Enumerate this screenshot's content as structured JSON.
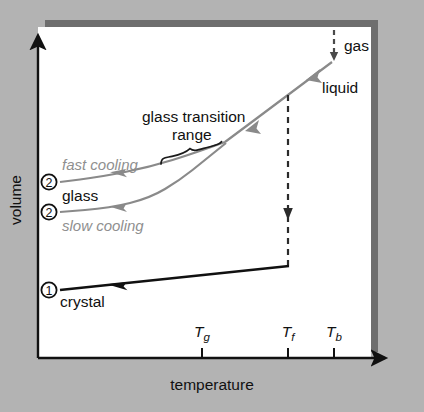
{
  "figure": {
    "background_color": "#b3b3b3",
    "panel_color": "#ffffff",
    "shadow_color": "#6e6e6e",
    "axis_color": "#111111",
    "crystal_color": "#111111",
    "glass_color": "#8a8a8a",
    "liquid_color": "#8a8a8a",
    "gray_label_color": "#8f8f8f"
  },
  "axes": {
    "x_label": "temperature",
    "y_label": "volume",
    "x_ticks": [
      {
        "label": "Tg",
        "base": "T",
        "sub": "g",
        "x": 202
      },
      {
        "label": "Tf",
        "base": "T",
        "sub": "f",
        "x": 288
      },
      {
        "label": "Tb",
        "base": "T",
        "sub": "b",
        "x": 334
      }
    ]
  },
  "labels": {
    "gas": "gas",
    "liquid": "liquid",
    "glass": "glass",
    "crystal": "crystal",
    "fast_cooling": "fast cooling",
    "slow_cooling": "slow cooling",
    "glass_transition_line1": "glass transition",
    "glass_transition_line2": "range",
    "state_marker_one": "1",
    "state_marker_two_fast": "2",
    "state_marker_two_slow": "2"
  },
  "chart_data": {
    "type": "line",
    "title": "",
    "xlabel": "temperature",
    "ylabel": "volume",
    "grid": false,
    "legend": "none",
    "axis_note": "Qualitative schematic: volume versus temperature on cooling; axes unitless with named transition temperatures Tg (glass transition), Tf (freezing/melting), Tb (boiling).",
    "x_tick_labels": [
      "Tg",
      "Tf",
      "Tb"
    ],
    "annotations": [
      "gas",
      "liquid",
      "glass",
      "crystal",
      "fast cooling",
      "slow cooling",
      "glass transition range",
      "1",
      "2",
      "2"
    ],
    "series": [
      {
        "name": "gas-to-liquid condensation (dashed, Tb)",
        "style": "dashed",
        "color": "#4a4a4a",
        "arrow": "down",
        "points": [
          [
            334,
            30
          ],
          [
            334,
            60
          ]
        ]
      },
      {
        "name": "liquid",
        "style": "solid",
        "color": "#8a8a8a",
        "arrow": "left",
        "points": [
          [
            332,
            62
          ],
          [
            288,
            95
          ],
          [
            225,
            142
          ]
        ]
      },
      {
        "name": "liquid-to-crystal freezing (dashed, Tf)",
        "style": "dashed",
        "color": "#2b2b2b",
        "arrow": "down",
        "points": [
          [
            288,
            95
          ],
          [
            288,
            266
          ]
        ]
      },
      {
        "name": "crystal",
        "style": "solid",
        "color": "#111111",
        "arrow": "left",
        "points": [
          [
            289,
            266
          ],
          [
            60,
            290
          ]
        ]
      },
      {
        "name": "fast cooling glass",
        "style": "solid",
        "color": "#8a8a8a",
        "arrow": "left",
        "points": [
          [
            225,
            142
          ],
          [
            195,
            153
          ],
          [
            150,
            167
          ],
          [
            100,
            177
          ],
          [
            60,
            182
          ]
        ]
      },
      {
        "name": "slow cooling glass",
        "style": "solid",
        "color": "#8a8a8a",
        "arrow": "left",
        "points": [
          [
            226,
            143
          ],
          [
            205,
            160
          ],
          [
            180,
            180
          ],
          [
            150,
            198
          ],
          [
            110,
            208
          ],
          [
            60,
            212
          ]
        ]
      }
    ]
  }
}
